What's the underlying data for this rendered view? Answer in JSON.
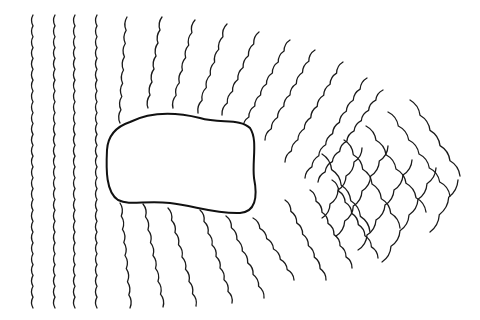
{
  "diagram": {
    "title": "",
    "colors": {
      "background": "#ffffff",
      "line": "#1a1a1a",
      "island_outline": "#111111"
    },
    "island": {
      "path": "M 130 122 C 150 112, 175 112, 200 118 C 220 124, 240 118, 250 128 C 258 140, 252 160, 254 178 C 258 198, 255 212, 240 213 C 215 214, 195 206, 170 203 C 145 200, 130 206, 118 200 C 106 192, 106 170, 107 150 C 108 134, 118 126, 130 122 Z"
    },
    "straight_waves": [
      {
        "x": 33,
        "y0": 15,
        "y1": 308
      },
      {
        "x": 55,
        "y0": 15,
        "y1": 308
      },
      {
        "x": 75,
        "y0": 15,
        "y1": 308
      },
      {
        "x": 97,
        "y0": 15,
        "y1": 308
      }
    ],
    "top_bent_waves": [
      {
        "x0": 127,
        "y0": 17,
        "x1": 120,
        "y1": 123
      },
      {
        "x0": 162,
        "y0": 17,
        "x1": 148,
        "y1": 108
      },
      {
        "x0": 195,
        "y0": 20,
        "x1": 173,
        "y1": 108
      },
      {
        "x0": 227,
        "y0": 24,
        "x1": 198,
        "y1": 113
      },
      {
        "x0": 259,
        "y0": 32,
        "x1": 222,
        "y1": 115
      },
      {
        "x0": 290,
        "y0": 40,
        "x1": 243,
        "y1": 128
      },
      {
        "x0": 315,
        "y0": 50,
        "x1": 265,
        "y1": 140
      },
      {
        "x0": 343,
        "y0": 62,
        "x1": 285,
        "y1": 162
      },
      {
        "x0": 367,
        "y0": 78,
        "x1": 305,
        "y1": 178
      },
      {
        "x0": 383,
        "y0": 90,
        "x1": 318,
        "y1": 182
      }
    ],
    "bottom_bent_waves": [
      {
        "x0": 120,
        "y0": 203,
        "x1": 130,
        "y1": 308
      },
      {
        "x0": 143,
        "y0": 204,
        "x1": 163,
        "y1": 307
      },
      {
        "x0": 168,
        "y0": 208,
        "x1": 196,
        "y1": 306
      },
      {
        "x0": 200,
        "y0": 210,
        "x1": 232,
        "y1": 303
      },
      {
        "x0": 226,
        "y0": 216,
        "x1": 264,
        "y1": 298
      },
      {
        "x0": 253,
        "y0": 218,
        "x1": 294,
        "y1": 280
      },
      {
        "x0": 285,
        "y0": 200,
        "x1": 326,
        "y1": 280
      },
      {
        "x0": 310,
        "y0": 190,
        "x1": 352,
        "y1": 268
      },
      {
        "x0": 332,
        "y0": 180,
        "x1": 378,
        "y1": 258
      }
    ],
    "crossing_zone": {
      "down_right": [
        {
          "x0": 322,
          "y0": 154,
          "x1": 370,
          "y1": 232
        },
        {
          "x0": 344,
          "y0": 140,
          "x1": 400,
          "y1": 228
        },
        {
          "x0": 366,
          "y0": 126,
          "x1": 426,
          "y1": 212
        },
        {
          "x0": 388,
          "y0": 112,
          "x1": 450,
          "y1": 196
        },
        {
          "x0": 410,
          "y0": 100,
          "x1": 460,
          "y1": 176
        }
      ],
      "up_right": [
        {
          "x0": 336,
          "y0": 236,
          "x1": 388,
          "y1": 146
        },
        {
          "x0": 358,
          "y0": 250,
          "x1": 412,
          "y1": 160
        },
        {
          "x0": 382,
          "y0": 262,
          "x1": 436,
          "y1": 168
        },
        {
          "x0": 322,
          "y0": 218,
          "x1": 362,
          "y1": 148
        },
        {
          "x0": 430,
          "y0": 232,
          "x1": 458,
          "y1": 180
        }
      ]
    }
  }
}
